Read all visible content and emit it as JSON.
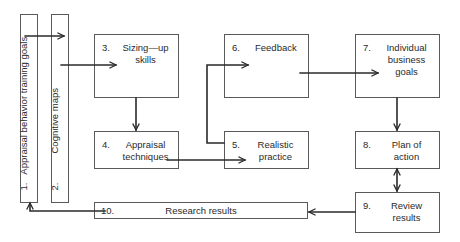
{
  "diagram": {
    "nodes": [
      {
        "id": "1",
        "number": "1.",
        "label": "Appraisal behavior training goals",
        "orientation": "vertical"
      },
      {
        "id": "2",
        "number": "2.",
        "label": "Cognitive maps",
        "orientation": "vertical"
      },
      {
        "id": "3",
        "number": "3.",
        "label": "Sizing—up\nskills"
      },
      {
        "id": "4",
        "number": "4.",
        "label": "Appraisal\ntechniques"
      },
      {
        "id": "5",
        "number": "5.",
        "label": "Realistic\npractice"
      },
      {
        "id": "6",
        "number": "6.",
        "label": "Feedback"
      },
      {
        "id": "7",
        "number": "7.",
        "label": "Individual\nbusiness\ngoals"
      },
      {
        "id": "8",
        "number": "8.",
        "label": "Plan of\naction"
      },
      {
        "id": "9",
        "number": "9.",
        "label": "Review\nresults"
      },
      {
        "id": "10",
        "number": "10.",
        "label": "Research results",
        "orientation": "horizontal-bar"
      }
    ],
    "edges": [
      {
        "from": "1",
        "to": "2"
      },
      {
        "from": "2",
        "to": "3"
      },
      {
        "from": "3",
        "to": "4"
      },
      {
        "from": "4",
        "to": "5"
      },
      {
        "from": "5",
        "to": "6"
      },
      {
        "from": "6",
        "to": "7"
      },
      {
        "from": "7",
        "to": "8"
      },
      {
        "from": "8",
        "to": "9",
        "bidirectional": true
      },
      {
        "from": "9",
        "to": "10"
      },
      {
        "from": "10",
        "to": "1"
      }
    ],
    "colors": {
      "line": "#2a2a2a",
      "border": "#5a5a5a",
      "background": "#ffffff"
    }
  }
}
